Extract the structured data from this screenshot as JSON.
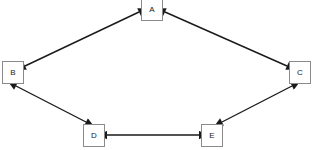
{
  "diagram": {
    "background_color": "#ffffff",
    "node_border_color": "#8a8a8a",
    "node_fill_color": "#ffffff",
    "edge_color": "#1a1a1a",
    "nodes": [
      {
        "id": "A",
        "label": "A",
        "x": 152,
        "y": 9
      },
      {
        "id": "B",
        "label": "B",
        "x": 13,
        "y": 72
      },
      {
        "id": "C",
        "label": "C",
        "x": 300,
        "y": 72
      },
      {
        "id": "D",
        "label": "D",
        "x": 94,
        "y": 135
      },
      {
        "id": "E",
        "label": "E",
        "x": 212,
        "y": 135
      }
    ],
    "edges": [
      {
        "from": "A",
        "to": "B",
        "direction": "bidirectional",
        "x1": 139,
        "y1": 12,
        "x2": 25,
        "y2": 66
      },
      {
        "from": "A",
        "to": "C",
        "direction": "bidirectional",
        "x1": 165,
        "y1": 12,
        "x2": 287,
        "y2": 66
      },
      {
        "from": "B",
        "to": "D",
        "direction": "bidirectional",
        "x1": 16,
        "y1": 86,
        "x2": 86,
        "y2": 122
      },
      {
        "from": "C",
        "to": "E",
        "direction": "bidirectional",
        "x1": 292,
        "y1": 86,
        "x2": 222,
        "y2": 122
      },
      {
        "from": "D",
        "to": "E",
        "direction": "bidirectional",
        "x1": 107,
        "y1": 135,
        "x2": 199,
        "y2": 135
      }
    ]
  }
}
